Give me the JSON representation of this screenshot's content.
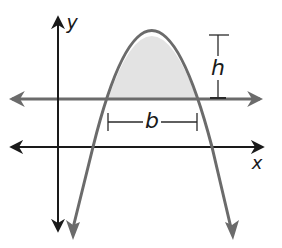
{
  "diagram": {
    "type": "parabola-area-diagram",
    "labels": {
      "y_axis": "y",
      "x_axis": "x",
      "base": "b",
      "height": "h"
    },
    "colors": {
      "axes": "#1a1a1a",
      "curve": "#6b6b6b",
      "horizontal_line": "#6b6b6b",
      "shaded_region": "#e3e3e3",
      "bracket": "#2a2a2a",
      "background": "#ffffff"
    },
    "elements": [
      "y-axis with arrows",
      "x-axis with arrows",
      "downward-opening parabola with arrowheads",
      "horizontal line intersecting parabola",
      "shaded parabolic segment above horizontal line",
      "base dimension bracket b",
      "height dimension bracket h"
    ]
  }
}
